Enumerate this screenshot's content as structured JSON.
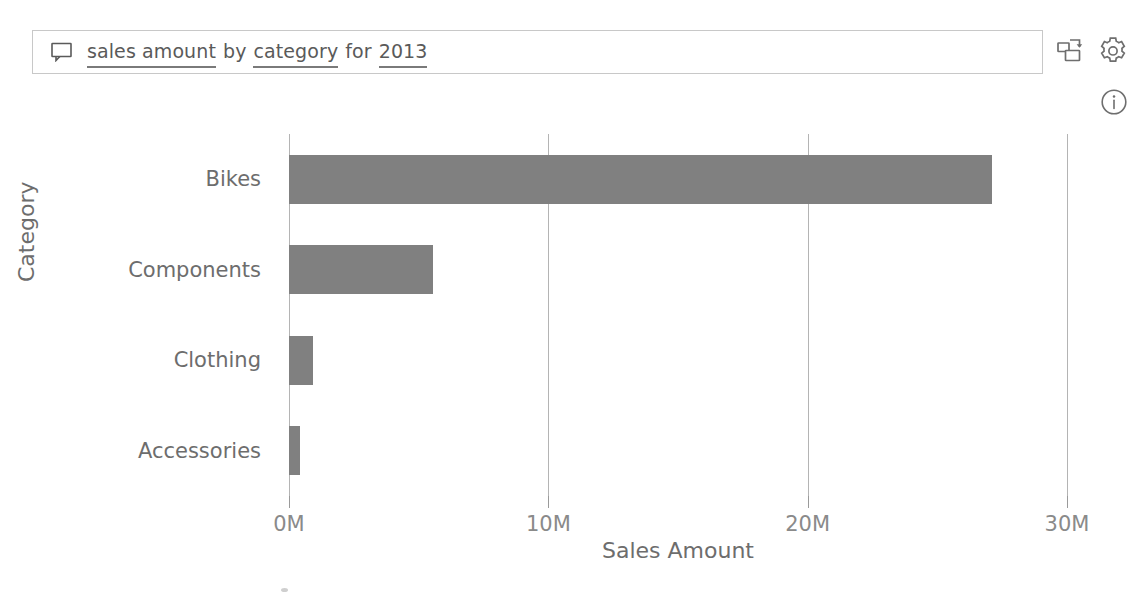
{
  "qna": {
    "icon": "speech-bubble-icon",
    "tokens": [
      {
        "text": "sales amount",
        "underlined": true
      },
      {
        "text": "by",
        "underlined": false
      },
      {
        "text": "category",
        "underlined": true
      },
      {
        "text": "for",
        "underlined": false
      },
      {
        "text": "2013",
        "underlined": true
      }
    ],
    "full_query": "sales amount by category for 2013",
    "placeholder": "Ask a question about your data"
  },
  "toolbar": {
    "pin_visual_label": "pin-visual-icon",
    "settings_label": "gear-icon",
    "info_label": "info-icon"
  },
  "colors": {
    "bar": "#808080",
    "gridline": "#b4b4b4",
    "text": "#6d6d6d",
    "border": "#c8c8c8"
  },
  "chart_data": {
    "type": "bar",
    "orientation": "horizontal",
    "title": "",
    "xlabel": "Sales Amount",
    "ylabel": "Category",
    "categories": [
      "Bikes",
      "Components",
      "Clothing",
      "Accessories"
    ],
    "values": [
      27100000,
      5540000,
      940000,
      410000
    ],
    "value_labels": [
      "27.1M",
      "5.5M",
      "0.9M",
      "0.4M"
    ],
    "xlim": [
      0,
      30000000
    ],
    "xticks": [
      0,
      10000000,
      20000000,
      30000000
    ],
    "xtick_labels": [
      "0M",
      "10M",
      "20M",
      "30M"
    ],
    "grid": true,
    "grid_axis": "x",
    "legend": false,
    "series": [
      {
        "name": "Sales Amount",
        "values": [
          27100000,
          5540000,
          940000,
          410000
        ]
      }
    ]
  }
}
